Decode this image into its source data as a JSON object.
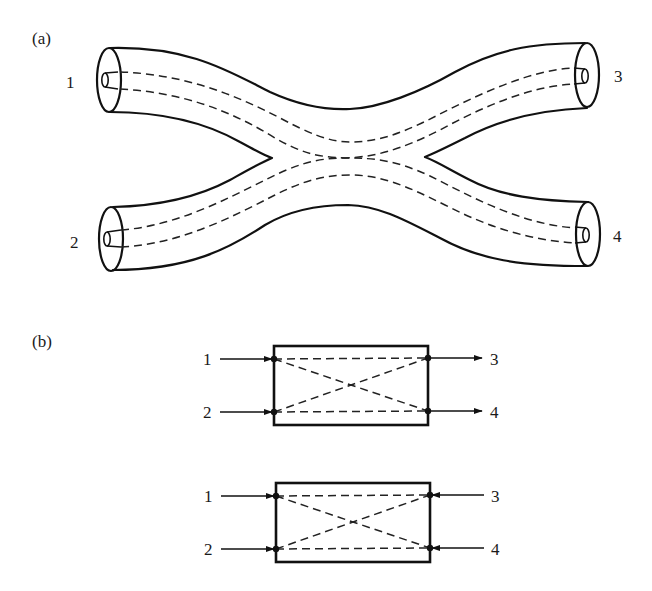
{
  "figure": {
    "panel_a": {
      "label": "(a)",
      "description": "Fused fiber directional coupler: two optical fibers whose cores converge and interact in a central coupling region",
      "ports": [
        {
          "id": "1",
          "label": "1",
          "side": "left-top"
        },
        {
          "id": "2",
          "label": "2",
          "side": "left-bottom"
        },
        {
          "id": "3",
          "label": "3",
          "side": "right-top"
        },
        {
          "id": "4",
          "label": "4",
          "side": "right-bottom"
        }
      ]
    },
    "panel_b": {
      "label": "(b)",
      "description": "Schematic four-port coupler block diagrams",
      "diagrams": [
        {
          "name": "co-directional",
          "inputs": [
            {
              "label": "1",
              "direction": "in"
            },
            {
              "label": "2",
              "direction": "in"
            }
          ],
          "outputs": [
            {
              "label": "3",
              "direction": "out"
            },
            {
              "label": "4",
              "direction": "out"
            }
          ]
        },
        {
          "name": "contra-directional",
          "inputs": [
            {
              "label": "1",
              "direction": "in"
            },
            {
              "label": "2",
              "direction": "in"
            }
          ],
          "outputs": [
            {
              "label": "3",
              "direction": "in"
            },
            {
              "label": "4",
              "direction": "in"
            }
          ]
        }
      ]
    }
  },
  "colors": {
    "stroke": "#111111",
    "background": "#ffffff"
  }
}
